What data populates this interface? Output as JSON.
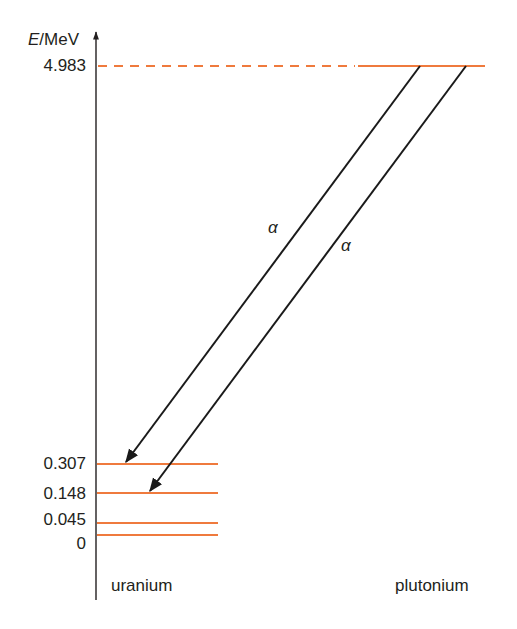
{
  "diagram": {
    "type": "energy-level-diagram",
    "axis_label_var": "E",
    "axis_label_unit": "/MeV",
    "colors": {
      "level": "#ef7a3d",
      "arrow": "#1a1a1a",
      "axis": "#231f20"
    },
    "levels": [
      {
        "label": "4.983",
        "energy": 4.983,
        "nucleus": "plutonium"
      },
      {
        "label": "0.307",
        "energy": 0.307,
        "nucleus": "uranium"
      },
      {
        "label": "0.148",
        "energy": 0.148,
        "nucleus": "uranium"
      },
      {
        "label": "0.045",
        "energy": 0.045,
        "nucleus": "uranium"
      },
      {
        "label": "0",
        "energy": 0,
        "nucleus": "uranium"
      }
    ],
    "transitions": [
      {
        "label": "α",
        "from": "4.983",
        "to": "0.307"
      },
      {
        "label": "α",
        "from": "4.983",
        "to": "0.148"
      }
    ],
    "nuclei": {
      "left": "uranium",
      "right": "plutonium"
    }
  }
}
